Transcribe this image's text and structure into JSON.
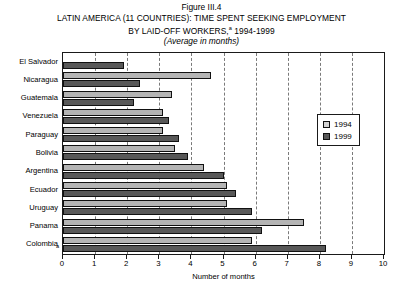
{
  "figure": {
    "number": "Figure III.4",
    "title_line1": "LATIN AMERICA (11 COUNTRIES): TIME SPENT SEEKING EMPLOYMENT",
    "title_line2_pre": "BY LAID-OFF WORKERS,",
    "title_footnote_marker": "a",
    "title_line2_post": " 1994-1999",
    "subtitle": "(Average in months)",
    "footnote_marker_plot": "a"
  },
  "legend": {
    "position": "top-right-inside",
    "entries": [
      {
        "label": "1994",
        "swatch": "legend-swatch-1994",
        "color": "#d2d2d2"
      },
      {
        "label": "1999",
        "swatch": "legend-swatch-1999",
        "color": "#585858"
      }
    ]
  },
  "colors": {
    "series_1994": "#b4b4b4",
    "series_1999": "#585858",
    "axis": "#1a1a1a",
    "gridline": "#7a7a7a",
    "background": "#ffffff"
  },
  "chart_data": {
    "type": "bar",
    "orientation": "horizontal",
    "subtitle": "(Average in months)",
    "xlabel": "Number of months",
    "ylabel": "",
    "xlim": [
      0,
      10
    ],
    "xticks": [
      0,
      1,
      2,
      3,
      4,
      5,
      6,
      7,
      8,
      9,
      10
    ],
    "xtick_labels": [
      "0",
      "1",
      "2",
      "3",
      "4",
      "5",
      "6",
      "7",
      "8",
      "9",
      "10"
    ],
    "grid": "vertical-dashed",
    "legend_position": "upper right inside plot",
    "categories": [
      "El Salvador",
      "Nicaragua",
      "Guatemala",
      "Venezuela",
      "Paraguay",
      "Bolivia",
      "Argentina",
      "Ecuador",
      "Uruguay",
      "Panama",
      "Colombia"
    ],
    "series": [
      {
        "name": "1994",
        "color": "#b4b4b4",
        "values": [
          null,
          4.6,
          3.4,
          3.1,
          3.1,
          3.5,
          4.4,
          5.1,
          5.1,
          7.5,
          5.9
        ]
      },
      {
        "name": "1999",
        "color": "#585858",
        "values": [
          1.9,
          2.4,
          2.2,
          3.3,
          3.6,
          3.9,
          5.0,
          5.4,
          5.9,
          6.2,
          8.2
        ]
      }
    ]
  }
}
